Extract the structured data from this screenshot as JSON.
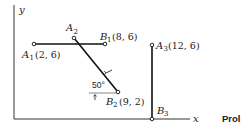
{
  "diagram": {
    "axes": {
      "x_label": "x",
      "y_label": "y"
    },
    "points": {
      "A1": {
        "name": "A",
        "sub": "1",
        "coords": "(2, 6)"
      },
      "B1": {
        "name": "B",
        "sub": "1",
        "coords": "(8, 6)"
      },
      "A2": {
        "name": "A",
        "sub": "2",
        "coords": ""
      },
      "B2": {
        "name": "B",
        "sub": "2",
        "coords": "(9, 2)"
      },
      "A3": {
        "name": "A",
        "sub": "3",
        "coords": "(12, 6)"
      },
      "B3": {
        "name": "B",
        "sub": "3",
        "coords": ""
      }
    },
    "angle_label": "50°",
    "caption_fragment": "Prol",
    "segments": [
      {
        "from": "A1",
        "to": "B1",
        "orientation": "horizontal"
      },
      {
        "from": "A2",
        "to": "B2",
        "orientation": "inclined 50° to horizontal"
      },
      {
        "from": "A3",
        "to": "B3",
        "orientation": "vertical"
      }
    ]
  }
}
